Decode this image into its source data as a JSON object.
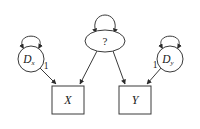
{
  "diagram": {
    "type": "path-diagram",
    "title": "",
    "background_color": "#ffffff",
    "stroke_color": "#3a3a3a",
    "text_color": "#1a1a1a",
    "nodes": [
      {
        "id": "dx",
        "shape": "circle",
        "label": "D",
        "subscript": "x",
        "cx": 31,
        "cy": 59,
        "r": 13
      },
      {
        "id": "question",
        "shape": "ellipse",
        "label": "?",
        "subscript": "",
        "cx": 105,
        "cy": 41,
        "rx": 20,
        "ry": 11
      },
      {
        "id": "dy",
        "shape": "circle",
        "label": "D",
        "subscript": "y",
        "cx": 170,
        "cy": 59,
        "r": 13
      },
      {
        "id": "x",
        "shape": "box",
        "label": "X",
        "subscript": "",
        "cx": 68,
        "cy": 100,
        "w": 32,
        "h": 28
      },
      {
        "id": "y",
        "shape": "box",
        "label": "Y",
        "subscript": "",
        "cx": 135,
        "cy": 100,
        "w": 32,
        "h": 28
      }
    ],
    "self_loops": [
      {
        "id": "dx-loop",
        "node": "dx",
        "double_headed": true
      },
      {
        "id": "question-loop",
        "node": "question",
        "double_headed": true
      },
      {
        "id": "dy-loop",
        "node": "dy",
        "double_headed": true
      }
    ],
    "edges": [
      {
        "id": "dx-to-x",
        "from": "dx",
        "to": "x",
        "label": "1"
      },
      {
        "id": "question-to-x",
        "from": "question",
        "to": "x",
        "label": ""
      },
      {
        "id": "question-to-y",
        "from": "question",
        "to": "y",
        "label": ""
      },
      {
        "id": "dy-to-y",
        "from": "dy",
        "to": "y",
        "label": "1"
      }
    ],
    "edge_labels": [
      {
        "id": "label-dx-x",
        "text": "1",
        "x": 46,
        "y": 67
      },
      {
        "id": "label-dy-y",
        "text": "1",
        "x": 155,
        "y": 66
      }
    ]
  }
}
